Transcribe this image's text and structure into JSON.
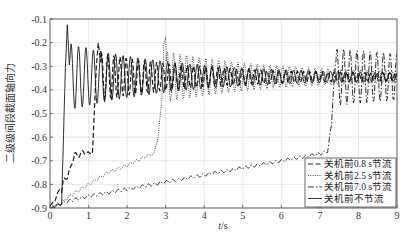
{
  "chart_data": {
    "type": "line",
    "title": "",
    "xlabel": "t/s",
    "ylabel": "二级级间段截面轴向力",
    "xlim": [
      0,
      9
    ],
    "ylim": [
      -0.9,
      -0.1
    ],
    "xticks": [
      0,
      1,
      2,
      3,
      4,
      5,
      6,
      7,
      8,
      9
    ],
    "yticks": [
      -0.1,
      -0.2,
      -0.3,
      -0.4,
      -0.5,
      -0.6,
      -0.7,
      -0.8,
      -0.9
    ],
    "grid": true,
    "legend_position": "lower right",
    "series": [
      {
        "name": "关机前0.8 s节流",
        "style": "dashed",
        "x": [
          0,
          0.15,
          0.25,
          0.3,
          0.35,
          0.45,
          0.55,
          0.65,
          0.75,
          0.85,
          0.95,
          1.05,
          1.1,
          1.15,
          1.2,
          1.25,
          1.3,
          1.4,
          1.5,
          2.0,
          3.0,
          4.0,
          5.0,
          6.0,
          7.0,
          8.0,
          9.0
        ],
        "y": [
          -0.89,
          -0.86,
          -0.82,
          -0.83,
          -0.78,
          -0.77,
          -0.72,
          -0.67,
          -0.68,
          -0.66,
          -0.67,
          -0.665,
          -0.67,
          -0.5,
          -0.3,
          -0.2,
          -0.27,
          -0.38,
          -0.3,
          -0.34,
          -0.33,
          -0.34,
          -0.345,
          -0.35,
          -0.35,
          -0.35,
          -0.35
        ]
      },
      {
        "name": "关机前2.5 s节流",
        "style": "dotted",
        "x": [
          0,
          0.3,
          0.5,
          1.0,
          1.5,
          2.0,
          2.5,
          2.7,
          2.8,
          2.9,
          2.95,
          3.0,
          3.1,
          3.5,
          4.0,
          5.0,
          6.0,
          7.0,
          8.0,
          9.0
        ],
        "y": [
          -0.89,
          -0.88,
          -0.85,
          -0.8,
          -0.75,
          -0.72,
          -0.68,
          -0.67,
          -0.6,
          -0.45,
          -0.2,
          -0.18,
          -0.35,
          -0.32,
          -0.34,
          -0.34,
          -0.35,
          -0.35,
          -0.35,
          -0.35
        ]
      },
      {
        "name": "关机前7.0 s节流",
        "style": "dashdot",
        "x": [
          0,
          0.3,
          0.5,
          1.0,
          2.0,
          3.0,
          4.0,
          5.0,
          6.0,
          7.0,
          7.2,
          7.3,
          7.35,
          7.4,
          7.5,
          8.0,
          9.0
        ],
        "y": [
          -0.9,
          -0.88,
          -0.87,
          -0.85,
          -0.82,
          -0.79,
          -0.76,
          -0.73,
          -0.7,
          -0.67,
          -0.66,
          -0.55,
          -0.4,
          -0.3,
          -0.33,
          -0.35,
          -0.35
        ]
      },
      {
        "name": "关机前不节流",
        "style": "solid",
        "x": [
          0,
          0.2,
          0.3,
          0.35,
          0.4,
          0.45,
          0.5,
          0.6,
          0.7,
          0.8,
          1.0,
          1.5,
          2.0,
          3.0,
          4.0,
          5.0,
          6.0,
          7.0,
          7.25,
          7.3,
          7.4,
          7.5,
          8.0,
          9.0
        ],
        "y": [
          -0.9,
          -0.89,
          -0.88,
          -0.6,
          -0.3,
          -0.12,
          -0.3,
          -0.5,
          -0.25,
          -0.48,
          -0.26,
          -0.35,
          -0.34,
          -0.34,
          -0.34,
          -0.35,
          -0.35,
          -0.35,
          -0.35,
          -0.2,
          -0.5,
          -0.3,
          -0.35,
          -0.35
        ]
      }
    ]
  },
  "axes": {
    "x_label_italic": "t",
    "x_label_unit": "/s",
    "y_label": "二级级间段截面轴向力",
    "x_tick_labels": [
      "0",
      "1",
      "2",
      "3",
      "4",
      "5",
      "6",
      "7",
      "8",
      "9"
    ],
    "y_tick_labels": [
      "-0.1",
      "-0.2",
      "-0.3",
      "-0.4",
      "-0.5",
      "-0.6",
      "-0.7",
      "-0.8",
      "-0.9"
    ]
  },
  "legend": {
    "items": [
      {
        "label": "关机前0.8 s节流",
        "style": "dashed"
      },
      {
        "label": "关机前2.5 s节流",
        "style": "dotted"
      },
      {
        "label": "关机前7.0 s节流",
        "style": "dashdot"
      },
      {
        "label": "关机前不节流",
        "style": "solid"
      }
    ]
  },
  "colors": {
    "line": "#1a1a1a",
    "grid": "#d8d8d8",
    "frame": "#555555",
    "text": "#333333"
  }
}
